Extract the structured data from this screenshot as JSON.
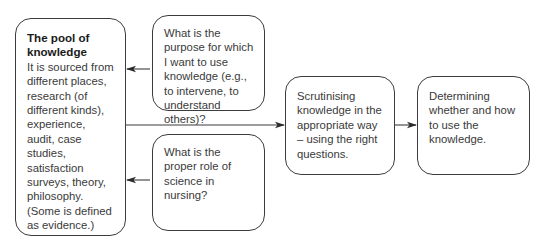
{
  "diagram": {
    "type": "flowchart",
    "nodes": [
      {
        "id": "pool",
        "title": "The pool of knowledge",
        "text": "It is sourced from different places, research (of different kinds), experience, audit, case studies, satisfaction surveys, theory, philosophy. (Some is defined as evidence.)"
      },
      {
        "id": "purpose",
        "text": "What is the purpose for which I want to use knowledge (e.g., to intervene, to understand others)?"
      },
      {
        "id": "science",
        "text": "What is the proper role of science in nursing?"
      },
      {
        "id": "scrutinise",
        "text": "Scrutinising knowledge in the appropriate way – using the right questions."
      },
      {
        "id": "determine",
        "text": "Determining whether and how to use the knowledge."
      }
    ],
    "edges": [
      {
        "from": "purpose",
        "to": "pool"
      },
      {
        "from": "science",
        "to": "pool"
      },
      {
        "from": "pool",
        "to": "scrutinise"
      },
      {
        "from": "scrutinise",
        "to": "determine"
      }
    ],
    "colors": {
      "stroke": "#3c3c3c",
      "text": "#3a3a3a",
      "background": "#ffffff"
    }
  }
}
